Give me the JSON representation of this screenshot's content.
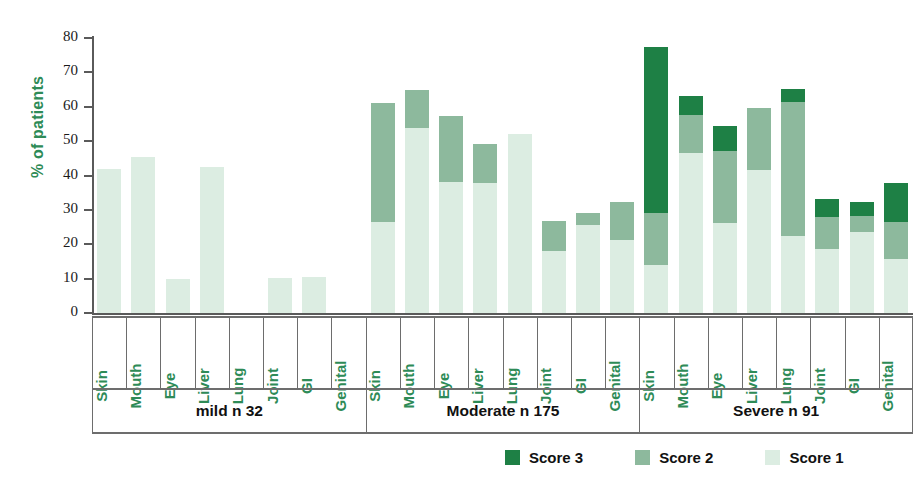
{
  "chart_data": {
    "type": "bar",
    "subtype": "stacked-grouped",
    "title": "",
    "xlabel": "",
    "ylabel": "% of patients",
    "ylim": [
      0,
      80
    ],
    "ytick_values": [
      0,
      10,
      20,
      30,
      40,
      50,
      60,
      70,
      80
    ],
    "ytick_labels": [
      "0",
      "10",
      "20",
      "30",
      "40",
      "50",
      "60",
      "70",
      "80"
    ],
    "grid": false,
    "legend_position": "bottom-right",
    "categories": [
      "Skin",
      "Mouth",
      "Eye",
      "Liver",
      "Lung",
      "Joint",
      "GI",
      "Genital"
    ],
    "legend": [
      {
        "name": "Score 3",
        "color": "#1E8045"
      },
      {
        "name": "Score 2",
        "color": "#8DB99D"
      },
      {
        "name": "Score 1",
        "color": "#DCEDE2"
      }
    ],
    "series": [
      {
        "name": "Score 3",
        "color": "#1E8045"
      },
      {
        "name": "Score 2",
        "color": "#8DB99D"
      },
      {
        "name": "Score 1",
        "color": "#DCEDE2"
      }
    ],
    "groups": [
      {
        "label": "mild n 32",
        "n": 32,
        "bars": [
          {
            "category": "Skin",
            "score1": 42.0,
            "score2": 0.0,
            "score3": 0.0,
            "total": 42.0
          },
          {
            "category": "Mouth",
            "score1": 45.5,
            "score2": 0.0,
            "score3": 0.0,
            "total": 45.5
          },
          {
            "category": "Eye",
            "score1": 10.0,
            "score2": 0.0,
            "score3": 0.0,
            "total": 10.0
          },
          {
            "category": "Liver",
            "score1": 42.5,
            "score2": 0.0,
            "score3": 0.0,
            "total": 42.5
          },
          {
            "category": "Lung",
            "score1": 0.0,
            "score2": 0.0,
            "score3": 0.0,
            "total": 0.0
          },
          {
            "category": "Joint",
            "score1": 10.3,
            "score2": 0.0,
            "score3": 0.0,
            "total": 10.3
          },
          {
            "category": "GI",
            "score1": 10.5,
            "score2": 0.0,
            "score3": 0.0,
            "total": 10.5
          },
          {
            "category": "Genital",
            "score1": 0.0,
            "score2": 0.0,
            "score3": 0.0,
            "total": 0.0
          }
        ]
      },
      {
        "label": "Moderate n 175",
        "n": 175,
        "bars": [
          {
            "category": "Skin",
            "score1": 26.5,
            "score2": 34.5,
            "score3": 0.0,
            "total": 61.0
          },
          {
            "category": "Mouth",
            "score1": 53.7,
            "score2": 11.1,
            "score3": 0.0,
            "total": 64.8
          },
          {
            "category": "Eye",
            "score1": 38.0,
            "score2": 19.3,
            "score3": 0.0,
            "total": 57.3
          },
          {
            "category": "Liver",
            "score1": 37.8,
            "score2": 11.3,
            "score3": 0.0,
            "total": 49.1
          },
          {
            "category": "Lung",
            "score1": 52.0,
            "score2": 0.0,
            "score3": 0.0,
            "total": 52.0
          },
          {
            "category": "Joint",
            "score1": 18.0,
            "score2": 8.8,
            "score3": 0.0,
            "total": 26.8
          },
          {
            "category": "GI",
            "score1": 25.5,
            "score2": 3.5,
            "score3": 0.0,
            "total": 29.0
          },
          {
            "category": "Genital",
            "score1": 21.3,
            "score2": 10.9,
            "score3": 0.0,
            "total": 32.2
          }
        ]
      },
      {
        "label": "Severe n 91",
        "n": 91,
        "bars": [
          {
            "category": "Skin",
            "score1": 14.0,
            "score2": 15.0,
            "score3": 48.5,
            "total": 77.5
          },
          {
            "category": "Mouth",
            "score1": 46.5,
            "score2": 11.0,
            "score3": 5.7,
            "total": 63.2
          },
          {
            "category": "Eye",
            "score1": 26.3,
            "score2": 20.7,
            "score3": 7.5,
            "total": 54.5
          },
          {
            "category": "Liver",
            "score1": 41.5,
            "score2": 18.2,
            "score3": 0.0,
            "total": 59.7
          },
          {
            "category": "Lung",
            "score1": 22.3,
            "score2": 39.2,
            "score3": 3.8,
            "total": 65.3
          },
          {
            "category": "Joint",
            "score1": 18.5,
            "score2": 9.5,
            "score3": 5.2,
            "total": 33.2
          },
          {
            "category": "GI",
            "score1": 23.7,
            "score2": 4.6,
            "score3": 4.0,
            "total": 32.3
          },
          {
            "category": "Genital",
            "score1": 15.6,
            "score2": 10.9,
            "score3": 11.2,
            "total": 37.7
          }
        ]
      }
    ]
  }
}
